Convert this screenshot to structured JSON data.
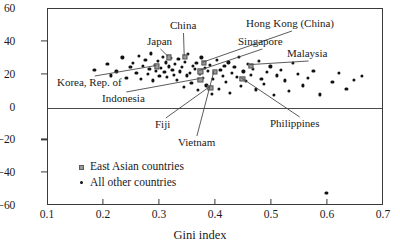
{
  "chart_data": {
    "type": "scatter",
    "title": "",
    "xlabel": "Gini index",
    "ylabel": "",
    "xlim": [
      0.1,
      0.7
    ],
    "ylim": [
      -60,
      60
    ],
    "xticks": [
      "0.1",
      "0.2",
      "0.3",
      "0.4",
      "0.5",
      "0.6",
      "0.7"
    ],
    "xtick_values": [
      0.1,
      0.2,
      0.3,
      0.4,
      0.5,
      0.6,
      0.7
    ],
    "yticks": [
      "60",
      "40",
      "20",
      "0",
      "−20",
      "−40",
      "−60"
    ],
    "ytick_values": [
      60,
      40,
      20,
      0,
      -20,
      -40,
      -60
    ],
    "grid": false,
    "zero_reference_line": 0,
    "legend_position": "lower-left-inside",
    "legend": [
      {
        "label": "East Asian countries",
        "marker": "square",
        "color": "#9a9a9a"
      },
      {
        "label": "All other countries",
        "marker": "dot",
        "color": "#111111"
      }
    ],
    "series": [
      {
        "name": "East Asian countries",
        "marker": "square",
        "points": [
          {
            "label": "Japan",
            "x": 0.316,
            "y": 30.5
          },
          {
            "label": "China",
            "x": 0.345,
            "y": 31.0
          },
          {
            "label": "Korea, Rep. of",
            "x": 0.295,
            "y": 25.0
          },
          {
            "label": "Hong Kong (China)",
            "x": 0.378,
            "y": 27.0
          },
          {
            "label": "Singapore",
            "x": 0.372,
            "y": 22.0
          },
          {
            "label": "Indonesia",
            "x": 0.372,
            "y": 17.0
          },
          {
            "label": "Fiji",
            "x": 0.39,
            "y": 12.0
          },
          {
            "label": "Malaysia",
            "x": 0.462,
            "y": 25.5
          },
          {
            "label": "Philippines",
            "x": 0.447,
            "y": 17.5
          },
          {
            "label": "Vietnam",
            "x": 0.398,
            "y": 21.5
          }
        ]
      },
      {
        "name": "All other countries",
        "marker": "dot",
        "x": [
          0.183,
          0.206,
          0.213,
          0.222,
          0.233,
          0.24,
          0.247,
          0.252,
          0.258,
          0.262,
          0.266,
          0.27,
          0.274,
          0.278,
          0.281,
          0.284,
          0.288,
          0.291,
          0.293,
          0.296,
          0.299,
          0.302,
          0.305,
          0.308,
          0.31,
          0.313,
          0.316,
          0.319,
          0.322,
          0.325,
          0.327,
          0.33,
          0.333,
          0.336,
          0.339,
          0.342,
          0.345,
          0.348,
          0.35,
          0.353,
          0.356,
          0.359,
          0.362,
          0.365,
          0.368,
          0.371,
          0.374,
          0.377,
          0.38,
          0.383,
          0.386,
          0.389,
          0.392,
          0.395,
          0.398,
          0.402,
          0.405,
          0.408,
          0.412,
          0.415,
          0.418,
          0.422,
          0.425,
          0.429,
          0.433,
          0.437,
          0.441,
          0.445,
          0.449,
          0.453,
          0.457,
          0.462,
          0.466,
          0.471,
          0.476,
          0.481,
          0.486,
          0.491,
          0.497,
          0.503,
          0.509,
          0.516,
          0.523,
          0.53,
          0.538,
          0.546,
          0.555,
          0.564,
          0.574,
          0.585,
          0.597,
          0.608,
          0.62,
          0.633,
          0.646,
          0.66
        ],
        "y": [
          23.0,
          26.5,
          19.5,
          22.0,
          30.5,
          18.0,
          24.5,
          27.0,
          21.0,
          31.5,
          17.5,
          25.5,
          29.0,
          20.5,
          23.5,
          33.0,
          16.5,
          26.0,
          22.5,
          28.5,
          19.0,
          24.0,
          31.0,
          21.5,
          27.5,
          18.5,
          25.0,
          30.0,
          23.0,
          20.0,
          26.5,
          17.0,
          29.5,
          22.0,
          24.5,
          12.5,
          28.0,
          19.5,
          32.5,
          21.0,
          15.0,
          25.5,
          23.5,
          27.0,
          10.5,
          20.5,
          30.5,
          18.0,
          24.0,
          13.5,
          22.5,
          26.0,
          8.5,
          17.5,
          21.5,
          29.0,
          11.5,
          23.0,
          19.0,
          25.5,
          15.5,
          27.5,
          9.0,
          21.0,
          24.5,
          18.5,
          31.0,
          13.0,
          22.0,
          16.0,
          26.5,
          20.0,
          23.5,
          11.0,
          28.5,
          17.5,
          14.5,
          21.5,
          25.0,
          7.5,
          19.5,
          23.0,
          16.5,
          10.0,
          27.0,
          20.5,
          13.5,
          18.0,
          22.5,
          8.0,
          -52.0,
          15.5,
          21.0,
          11.5,
          17.0,
          19.0
        ]
      }
    ],
    "annotations": [
      {
        "name": "China",
        "text": "China",
        "lx": 170,
        "ly": 20
      },
      {
        "name": "Japan",
        "text": "Japan",
        "lx": 147,
        "ly": 36
      },
      {
        "name": "Hong Kong (China)",
        "text": "Hong Kong (China)",
        "lx": 246,
        "ly": 18
      },
      {
        "name": "Singapore",
        "text": "Singapore",
        "lx": 238,
        "ly": 36
      },
      {
        "name": "Malaysia",
        "text": "Malaysia",
        "lx": 287,
        "ly": 48
      },
      {
        "name": "Korea, Rep. of",
        "text": "Korea, Rep. of",
        "lx": 57,
        "ly": 77
      },
      {
        "name": "Indonesia",
        "text": "Indonesia",
        "lx": 102,
        "ly": 93
      },
      {
        "name": "Fiji",
        "text": "Fiji",
        "lx": 155,
        "ly": 119
      },
      {
        "name": "Vietnam",
        "text": "Vietnam",
        "lx": 178,
        "ly": 137
      },
      {
        "name": "Philippines",
        "text": "Philippines",
        "lx": 270,
        "ly": 118
      }
    ]
  },
  "axes": {
    "x_label": "Gini index"
  }
}
